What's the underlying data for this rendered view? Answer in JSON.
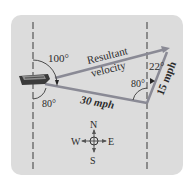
{
  "diagram": {
    "labels": {
      "resultant_line1": "Resultant",
      "resultant_line2": "velocity",
      "boat_speed": "30 mph",
      "current_speed": "15 mph",
      "angle_top_left": "100°",
      "angle_bottom_left": "80°",
      "angle_right_inner": "80°",
      "angle_right_top": "22°"
    },
    "compass": {
      "north": "N",
      "south": "S",
      "east": "E",
      "west": "W"
    },
    "colors": {
      "panel": "#dcdcdc",
      "vector": "#8a8a95",
      "text": "#2b2b2b",
      "reference_lines": "#3a3a3a"
    }
  }
}
